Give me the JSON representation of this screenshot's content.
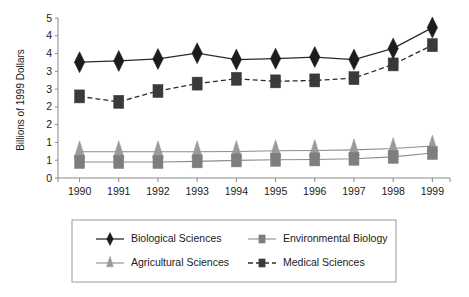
{
  "chart_data": {
    "type": "line",
    "title": "",
    "xlabel": "",
    "ylabel": "Billions of 1999 Dollars",
    "categories": [
      "1990",
      "1991",
      "1992",
      "1993",
      "1994",
      "1995",
      "1996",
      "1997",
      "1998",
      "1999"
    ],
    "x": [
      1990,
      1991,
      1992,
      1993,
      1994,
      1995,
      1996,
      1997,
      1998,
      1999
    ],
    "ylim": [
      0,
      5
    ],
    "ytick_values": [
      0,
      0.5,
      1,
      1.5,
      2,
      2.5,
      3,
      3.5,
      4,
      4.5,
      5
    ],
    "ytick_labels": [
      "0",
      "1",
      "1",
      "2",
      "2",
      "3",
      "3",
      "4",
      "4",
      "5"
    ],
    "ytick_labels_shown": [
      "5",
      "4",
      "4",
      "3",
      "3",
      "2",
      "2",
      "1",
      "1",
      "0"
    ],
    "grid": false,
    "legend_position": "bottom",
    "series": [
      {
        "name": "Biological Sciences",
        "marker": "diamond",
        "line_style": "solid",
        "color": "#1c1c1c",
        "values": [
          3.62,
          3.66,
          3.72,
          3.9,
          3.7,
          3.73,
          3.78,
          3.7,
          4.05,
          4.7
        ]
      },
      {
        "name": "Medical Sciences",
        "marker": "square",
        "line_style": "dashed",
        "color": "#3a3a3a",
        "values": [
          2.55,
          2.38,
          2.72,
          2.95,
          3.1,
          3.02,
          3.05,
          3.12,
          3.55,
          4.15
        ]
      },
      {
        "name": "Agricultural Sciences",
        "marker": "triangle",
        "line_style": "solid-thin",
        "color": "#9a9a9a",
        "values": [
          0.82,
          0.82,
          0.82,
          0.82,
          0.83,
          0.85,
          0.86,
          0.88,
          0.92,
          1.0
        ]
      },
      {
        "name": "Environmental Biology",
        "marker": "square",
        "line_style": "solid-thin",
        "color": "#7e7e7e",
        "values": [
          0.5,
          0.5,
          0.5,
          0.52,
          0.55,
          0.57,
          0.58,
          0.6,
          0.66,
          0.78
        ]
      }
    ],
    "legend_entries": [
      {
        "label": "Biological Sciences",
        "marker": "diamond",
        "color": "#1c1c1c",
        "line_style": "solid"
      },
      {
        "label": "Environmental Biology",
        "marker": "square",
        "color": "#7e7e7e",
        "line_style": "solid-thin"
      },
      {
        "label": "Agricultural Sciences",
        "marker": "triangle",
        "color": "#9a9a9a",
        "line_style": "solid-thin"
      },
      {
        "label": "Medical Sciences",
        "marker": "square",
        "color": "#3a3a3a",
        "line_style": "dashed"
      }
    ]
  }
}
